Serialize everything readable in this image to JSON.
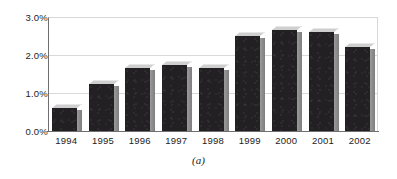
{
  "figure": {
    "caption": "(a)",
    "background_color": "#ffffff"
  },
  "style": {
    "bar_front_color": "#222022",
    "bar_top_color": "#cfcfcf",
    "bar_side_color": "#8d8d8d",
    "gridline_color": "#d9d9d9",
    "axis_color": "#6f6f6f",
    "text_color": "#1c1c1c"
  },
  "chart_data": {
    "type": "bar",
    "title": "",
    "subtitle": "",
    "xlabel": "",
    "ylabel": "",
    "categories": [
      "1994",
      "1995",
      "1996",
      "1997",
      "1998",
      "1999",
      "2000",
      "2001",
      "2002"
    ],
    "values": [
      0.6,
      1.25,
      1.65,
      1.75,
      1.65,
      2.5,
      2.65,
      2.6,
      2.2
    ],
    "value_format": "percent",
    "ylim": [
      0.0,
      3.0
    ],
    "ytick_values": [
      0.0,
      1.0,
      2.0,
      3.0
    ],
    "ytick_labels": [
      "0.0%",
      "1.0%",
      "2.0%",
      "3.0%"
    ],
    "grid": true,
    "grid_axis": "y",
    "legend": false,
    "legend_position": "none",
    "bar_style": "3d",
    "annotations": []
  }
}
